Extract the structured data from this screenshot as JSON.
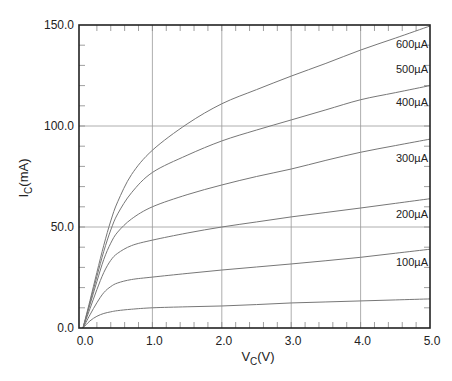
{
  "chart_data": {
    "type": "line",
    "title": "",
    "xlabel": "V",
    "xlabel_sub": "C",
    "xlabel_unit": "(V)",
    "ylabel": "I",
    "ylabel_sub": "C",
    "ylabel_unit": "(mA)",
    "xlim": [
      -0.05,
      5.0
    ],
    "ylim": [
      0,
      150
    ],
    "x_ticks": [
      0.0,
      1.0,
      2.0,
      3.0,
      4.0,
      5.0
    ],
    "x_tick_labels": [
      "0.0",
      "1.0",
      "2.0",
      "3.0",
      "4.0",
      "5.0"
    ],
    "y_ticks": [
      0,
      50,
      100,
      150
    ],
    "y_tick_labels": [
      "0.0",
      "50.0",
      "100.0",
      "150.0"
    ],
    "x_minor_step": 0.2,
    "y_minor_step": 10,
    "grid": true,
    "legend_position": "inline-right",
    "x": [
      0.0,
      0.1,
      0.2,
      0.3,
      0.4,
      0.5,
      0.7,
      1.0,
      1.5,
      2.0,
      2.5,
      3.0,
      3.5,
      4.0,
      4.5,
      5.0
    ],
    "series": [
      {
        "name": "100µA",
        "values": [
          0,
          3.5,
          5.8,
          7.2,
          8.0,
          8.6,
          9.3,
          10.0,
          10.5,
          10.9,
          11.6,
          12.4,
          12.9,
          13.4,
          13.9,
          14.4
        ]
      },
      {
        "name": "200µA",
        "values": [
          0,
          6.5,
          12.5,
          17.5,
          20.5,
          22.3,
          24.0,
          25.2,
          27.0,
          28.7,
          30.2,
          31.7,
          33.3,
          35.0,
          37.0,
          39.0
        ]
      },
      {
        "name": "300µA",
        "values": [
          0,
          9.5,
          19.0,
          27.5,
          33.5,
          37.0,
          40.8,
          43.5,
          47.0,
          50.0,
          52.5,
          55.0,
          57.2,
          59.4,
          61.7,
          64.0
        ]
      },
      {
        "name": "400µA",
        "values": [
          0,
          11.5,
          23.0,
          34.0,
          42.0,
          47.5,
          54.0,
          60.0,
          66.0,
          70.8,
          75.0,
          78.7,
          83.0,
          87.0,
          90.3,
          93.5
        ]
      },
      {
        "name": "500µA",
        "values": [
          0,
          12.5,
          25.5,
          38.0,
          48.5,
          56.5,
          67.0,
          77.0,
          85.5,
          92.6,
          98.0,
          103.0,
          108.0,
          113.0,
          116.5,
          120.0
        ]
      },
      {
        "name": "600µA",
        "values": [
          0,
          13.5,
          27.5,
          41.0,
          53.0,
          62.5,
          76.0,
          88.0,
          101.0,
          111.0,
          118.0,
          124.7,
          131.0,
          137.6,
          143.5,
          149.5
        ]
      }
    ]
  }
}
